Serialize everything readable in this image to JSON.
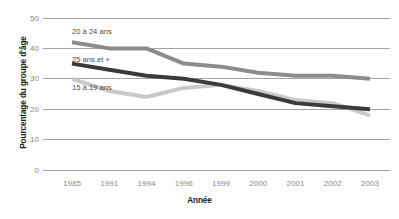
{
  "chart_data": {
    "type": "line",
    "title": "",
    "xlabel": "Année",
    "ylabel": "Pourcentage du groupe d'âge",
    "categories": [
      "1985",
      "1991",
      "1994",
      "1996",
      "1999",
      "2000",
      "2001",
      "2002",
      "2003"
    ],
    "ylim": [
      0,
      50
    ],
    "yticks": [
      0,
      10,
      20,
      30,
      40,
      50
    ],
    "ytick_labels": [
      "0",
      "10",
      "20",
      "30",
      "40",
      "50"
    ],
    "grid": true,
    "legend_position": "inline-labels",
    "series": [
      {
        "name": "20 à 24 ans",
        "color": "#8c8c8c",
        "values": [
          42,
          40,
          40,
          35,
          34,
          32,
          31,
          31,
          30
        ]
      },
      {
        "name": "25 ans et +",
        "color": "#3a3a3a",
        "values": [
          35,
          33,
          31,
          30,
          28,
          25,
          22,
          21,
          20
        ]
      },
      {
        "name": "15 à 19 ans",
        "color": "#c9c9c9",
        "values": [
          30,
          26,
          24,
          27,
          28,
          26,
          23,
          22,
          18
        ]
      }
    ]
  },
  "axis": {
    "x_title": "Année",
    "y_title": "Pourcentage du groupe d'âge"
  },
  "colors": {
    "series_20_24": "#8c8c8c",
    "series_25_plus": "#3a3a3a",
    "series_15_19": "#c9c9c9",
    "grid": "#9a9a9a",
    "tick_text": "#8a8a8a",
    "title_text": "#1b1b1b"
  }
}
